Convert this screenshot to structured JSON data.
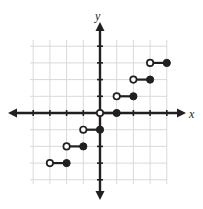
{
  "figure": {
    "name": "step-function-graph",
    "axis_labels": {
      "x": "x",
      "y": "y"
    },
    "colors": {
      "axis": "#231f20",
      "grid": "#d9d9d9",
      "point_fill": "#231f20",
      "open_fill": "#ffffff",
      "background": "#ffffff"
    }
  },
  "chart_data": {
    "type": "scatter",
    "title": "",
    "xlabel": "x",
    "ylabel": "y",
    "xlim": [
      -4,
      4
    ],
    "ylim": [
      -4,
      4
    ],
    "grid": true,
    "legend": "none",
    "x_ticks": [
      -4,
      -3,
      -2,
      -1,
      0,
      1,
      2,
      3,
      4
    ],
    "y_ticks": [
      -4,
      -3,
      -2,
      -1,
      0,
      1,
      2,
      3,
      4
    ],
    "tick_labels_shown": false,
    "series": [
      {
        "name": "step-segments",
        "segments": [
          {
            "y": -3,
            "x_start": -3,
            "x_end": -2,
            "left_endpoint": "open",
            "right_endpoint": "closed"
          },
          {
            "y": -2,
            "x_start": -2,
            "x_end": -1,
            "left_endpoint": "open",
            "right_endpoint": "closed"
          },
          {
            "y": -1,
            "x_start": -1,
            "x_end": 0,
            "left_endpoint": "open",
            "right_endpoint": "closed"
          },
          {
            "y": 0,
            "x_start": 0,
            "x_end": 1,
            "left_endpoint": "open",
            "right_endpoint": "closed"
          },
          {
            "y": 1,
            "x_start": 1,
            "x_end": 2,
            "left_endpoint": "open",
            "right_endpoint": "closed"
          },
          {
            "y": 2,
            "x_start": 2,
            "x_end": 3,
            "left_endpoint": "open",
            "right_endpoint": "closed"
          },
          {
            "y": 3,
            "x_start": 3,
            "x_end": 4,
            "left_endpoint": "open",
            "right_endpoint": "closed"
          }
        ]
      }
    ],
    "open_points": [
      {
        "x": -3,
        "y": -3
      },
      {
        "x": -2,
        "y": -2
      },
      {
        "x": -1,
        "y": -1
      },
      {
        "x": 0,
        "y": 0
      },
      {
        "x": 1,
        "y": 1
      },
      {
        "x": 2,
        "y": 2
      },
      {
        "x": 3,
        "y": 3
      }
    ],
    "closed_points": [
      {
        "x": -2,
        "y": -3
      },
      {
        "x": -1,
        "y": -2
      },
      {
        "x": 0,
        "y": -1
      },
      {
        "x": 1,
        "y": 0
      },
      {
        "x": 2,
        "y": 1
      },
      {
        "x": 3,
        "y": 2
      },
      {
        "x": 4,
        "y": 3
      }
    ]
  },
  "geometry": {
    "origin_px": {
      "x": 100,
      "y": 113
    },
    "unit_px": 16.7,
    "grid_rect_px": {
      "left": 30,
      "top": 40,
      "right": 167,
      "bottom": 184
    },
    "x_axis_px": {
      "x1": 8,
      "x2": 186,
      "y": 113
    },
    "y_axis_px": {
      "y1": 22,
      "y2": 200,
      "x": 100
    }
  }
}
